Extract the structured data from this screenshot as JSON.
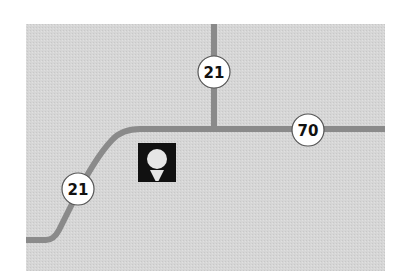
{
  "map": {
    "colors": {
      "background": "#ffffff",
      "land": "#d6d6d6",
      "road": "#8a8a8a",
      "shield_fill": "#ffffff",
      "shield_stroke": "#555555",
      "shield_text": "#111111",
      "poi_bg": "#111111",
      "poi_fg": "#e6e6e6"
    },
    "roads": [
      {
        "id": "route-21-north",
        "name": "Route 21"
      },
      {
        "id": "route-70",
        "name": "Route 70"
      },
      {
        "id": "route-21-southwest",
        "name": "Route 21"
      }
    ],
    "shields": [
      {
        "id": "shield-21-north",
        "label": "21"
      },
      {
        "id": "shield-70",
        "label": "70"
      },
      {
        "id": "shield-21-southwest",
        "label": "21"
      }
    ],
    "poi": {
      "id": "golf-course",
      "icon": "golf-ball-on-tee-icon"
    }
  }
}
